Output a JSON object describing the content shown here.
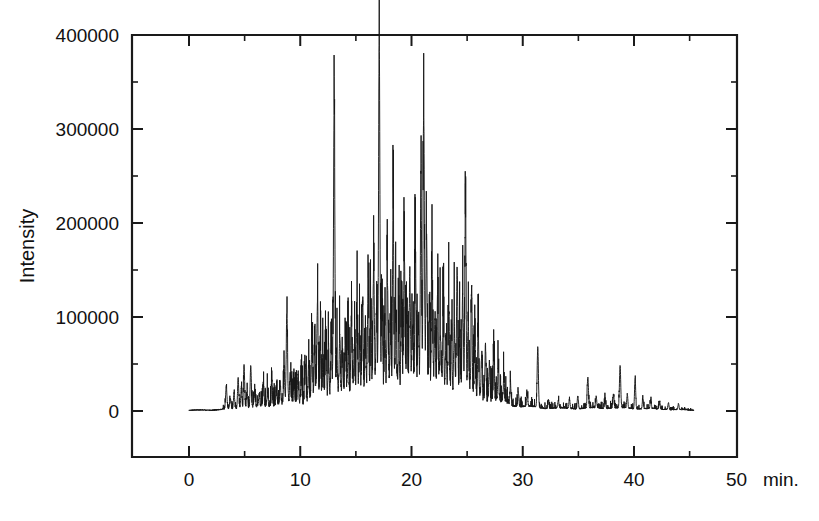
{
  "figure": {
    "name": "chromatogram-figure",
    "background_color": "#ffffff",
    "trace_color": "#171717",
    "axis_color": "#1a1a1a"
  },
  "chart_data": {
    "type": "line",
    "title": "",
    "subtitle": "",
    "xlabel": "",
    "xunit_label": "min.",
    "ylabel": "Intensity",
    "xlim": [
      -1.2,
      49.3
    ],
    "ylim": [
      -12000,
      400000
    ],
    "grid": false,
    "legend": null,
    "annotations": [],
    "x_ticks_major": [
      0,
      10,
      20,
      30,
      40,
      50
    ],
    "x_ticklabels": [
      "0",
      "10",
      "20",
      "30",
      "40",
      "50"
    ],
    "x_ticks_minor": [
      5,
      15,
      25,
      35,
      45
    ],
    "y_ticks_major": [
      0,
      100000,
      200000,
      300000,
      400000
    ],
    "y_ticklabels": [
      "0",
      "100000",
      "200000",
      "300000",
      "400000"
    ],
    "y_ticks_minor": [
      50000,
      150000,
      250000,
      350000
    ],
    "series": [
      {
        "name": "total ion chromatogram",
        "color": "#171717",
        "x_start": 0.0,
        "x_end": 45.4,
        "baseline_envelope": [
          {
            "x": 0.0,
            "y": 1500
          },
          {
            "x": 2.0,
            "y": 1800
          },
          {
            "x": 4.0,
            "y": 4000
          },
          {
            "x": 6.0,
            "y": 7000
          },
          {
            "x": 8.0,
            "y": 11000
          },
          {
            "x": 10.0,
            "y": 16000
          },
          {
            "x": 12.0,
            "y": 24000
          },
          {
            "x": 14.0,
            "y": 30000
          },
          {
            "x": 16.0,
            "y": 35000
          },
          {
            "x": 18.0,
            "y": 39000
          },
          {
            "x": 20.0,
            "y": 41000
          },
          {
            "x": 22.0,
            "y": 39000
          },
          {
            "x": 24.0,
            "y": 34000
          },
          {
            "x": 26.0,
            "y": 25000
          },
          {
            "x": 28.0,
            "y": 16000
          },
          {
            "x": 30.0,
            "y": 9000
          },
          {
            "x": 32.0,
            "y": 6000
          },
          {
            "x": 34.0,
            "y": 5000
          },
          {
            "x": 36.0,
            "y": 5500
          },
          {
            "x": 38.0,
            "y": 6000
          },
          {
            "x": 40.0,
            "y": 5000
          },
          {
            "x": 42.0,
            "y": 4000
          },
          {
            "x": 44.0,
            "y": 2500
          },
          {
            "x": 45.4,
            "y": 1500
          }
        ],
        "peaks": [
          {
            "x": 3.35,
            "h": 24000,
            "w": 0.055
          },
          {
            "x": 3.72,
            "h": 11000,
            "w": 0.05
          },
          {
            "x": 4.05,
            "h": 16000,
            "w": 0.05
          },
          {
            "x": 4.42,
            "h": 33000,
            "w": 0.05
          },
          {
            "x": 4.7,
            "h": 21000,
            "w": 0.05
          },
          {
            "x": 4.95,
            "h": 46000,
            "w": 0.05
          },
          {
            "x": 5.22,
            "h": 17000,
            "w": 0.05
          },
          {
            "x": 5.55,
            "h": 44000,
            "w": 0.05
          },
          {
            "x": 5.9,
            "h": 14000,
            "w": 0.05
          },
          {
            "x": 6.3,
            "h": 12000,
            "w": 0.05
          },
          {
            "x": 6.7,
            "h": 20000,
            "w": 0.05
          },
          {
            "x": 7.05,
            "h": 13000,
            "w": 0.05
          },
          {
            "x": 7.45,
            "h": 27000,
            "w": 0.05
          },
          {
            "x": 7.85,
            "h": 15000,
            "w": 0.05
          },
          {
            "x": 8.2,
            "h": 21000,
            "w": 0.05
          },
          {
            "x": 8.55,
            "h": 33000,
            "w": 0.05
          },
          {
            "x": 8.8,
            "h": 96000,
            "w": 0.055
          },
          {
            "x": 9.1,
            "h": 26000,
            "w": 0.05
          },
          {
            "x": 9.45,
            "h": 18000,
            "w": 0.05
          },
          {
            "x": 9.8,
            "h": 30000,
            "w": 0.05
          },
          {
            "x": 10.1,
            "h": 22000,
            "w": 0.05
          },
          {
            "x": 10.45,
            "h": 41000,
            "w": 0.05
          },
          {
            "x": 10.75,
            "h": 30000,
            "w": 0.05
          },
          {
            "x": 11.05,
            "h": 62000,
            "w": 0.055
          },
          {
            "x": 11.3,
            "h": 48000,
            "w": 0.05
          },
          {
            "x": 11.55,
            "h": 100000,
            "w": 0.055
          },
          {
            "x": 11.8,
            "h": 54000,
            "w": 0.05
          },
          {
            "x": 12.05,
            "h": 36000,
            "w": 0.05
          },
          {
            "x": 12.3,
            "h": 60000,
            "w": 0.05
          },
          {
            "x": 12.55,
            "h": 44000,
            "w": 0.05
          },
          {
            "x": 12.8,
            "h": 51000,
            "w": 0.05
          },
          {
            "x": 13.05,
            "h": 315000,
            "w": 0.06
          },
          {
            "x": 13.3,
            "h": 40000,
            "w": 0.05
          },
          {
            "x": 13.55,
            "h": 63000,
            "w": 0.05
          },
          {
            "x": 13.8,
            "h": 36000,
            "w": 0.05
          },
          {
            "x": 14.05,
            "h": 55000,
            "w": 0.05
          },
          {
            "x": 14.3,
            "h": 41000,
            "w": 0.05
          },
          {
            "x": 14.6,
            "h": 72000,
            "w": 0.05
          },
          {
            "x": 14.85,
            "h": 44000,
            "w": 0.05
          },
          {
            "x": 15.1,
            "h": 86000,
            "w": 0.055
          },
          {
            "x": 15.35,
            "h": 52000,
            "w": 0.05
          },
          {
            "x": 15.6,
            "h": 95000,
            "w": 0.055
          },
          {
            "x": 15.85,
            "h": 58000,
            "w": 0.05
          },
          {
            "x": 16.1,
            "h": 118000,
            "w": 0.055
          },
          {
            "x": 16.35,
            "h": 66000,
            "w": 0.05
          },
          {
            "x": 16.6,
            "h": 131000,
            "w": 0.055
          },
          {
            "x": 16.85,
            "h": 74000,
            "w": 0.05
          },
          {
            "x": 17.1,
            "h": 356000,
            "w": 0.06
          },
          {
            "x": 17.35,
            "h": 89000,
            "w": 0.05
          },
          {
            "x": 17.6,
            "h": 62000,
            "w": 0.05
          },
          {
            "x": 17.85,
            "h": 107000,
            "w": 0.055
          },
          {
            "x": 18.1,
            "h": 68000,
            "w": 0.05
          },
          {
            "x": 18.35,
            "h": 197000,
            "w": 0.055
          },
          {
            "x": 18.6,
            "h": 80000,
            "w": 0.05
          },
          {
            "x": 18.85,
            "h": 56000,
            "w": 0.05
          },
          {
            "x": 19.1,
            "h": 96000,
            "w": 0.05
          },
          {
            "x": 19.35,
            "h": 140000,
            "w": 0.055
          },
          {
            "x": 19.6,
            "h": 73000,
            "w": 0.05
          },
          {
            "x": 19.85,
            "h": 112000,
            "w": 0.055
          },
          {
            "x": 20.1,
            "h": 59000,
            "w": 0.05
          },
          {
            "x": 20.35,
            "h": 135000,
            "w": 0.055
          },
          {
            "x": 20.6,
            "h": 78000,
            "w": 0.05
          },
          {
            "x": 20.85,
            "h": 226000,
            "w": 0.055
          },
          {
            "x": 21.1,
            "h": 291000,
            "w": 0.06
          },
          {
            "x": 21.35,
            "h": 165000,
            "w": 0.055
          },
          {
            "x": 21.6,
            "h": 84000,
            "w": 0.05
          },
          {
            "x": 21.85,
            "h": 120000,
            "w": 0.055
          },
          {
            "x": 22.1,
            "h": 67000,
            "w": 0.05
          },
          {
            "x": 22.35,
            "h": 92000,
            "w": 0.05
          },
          {
            "x": 22.6,
            "h": 54000,
            "w": 0.05
          },
          {
            "x": 22.85,
            "h": 76000,
            "w": 0.05
          },
          {
            "x": 23.1,
            "h": 48000,
            "w": 0.05
          },
          {
            "x": 23.35,
            "h": 88000,
            "w": 0.05
          },
          {
            "x": 23.6,
            "h": 58000,
            "w": 0.05
          },
          {
            "x": 23.85,
            "h": 69000,
            "w": 0.05
          },
          {
            "x": 24.1,
            "h": 132000,
            "w": 0.055
          },
          {
            "x": 24.35,
            "h": 63000,
            "w": 0.05
          },
          {
            "x": 24.6,
            "h": 104000,
            "w": 0.055
          },
          {
            "x": 24.85,
            "h": 185000,
            "w": 0.055
          },
          {
            "x": 25.1,
            "h": 72000,
            "w": 0.05
          },
          {
            "x": 25.4,
            "h": 108000,
            "w": 0.05
          },
          {
            "x": 25.7,
            "h": 52000,
            "w": 0.05
          },
          {
            "x": 26.0,
            "h": 67000,
            "w": 0.05
          },
          {
            "x": 26.3,
            "h": 43000,
            "w": 0.05
          },
          {
            "x": 26.65,
            "h": 56000,
            "w": 0.05
          },
          {
            "x": 27.0,
            "h": 38000,
            "w": 0.05
          },
          {
            "x": 27.4,
            "h": 46000,
            "w": 0.05
          },
          {
            "x": 27.8,
            "h": 30000,
            "w": 0.05
          },
          {
            "x": 28.3,
            "h": 24000,
            "w": 0.05
          },
          {
            "x": 28.9,
            "h": 19000,
            "w": 0.05
          },
          {
            "x": 29.6,
            "h": 15000,
            "w": 0.05
          },
          {
            "x": 30.4,
            "h": 12000,
            "w": 0.05
          },
          {
            "x": 31.35,
            "h": 64000,
            "w": 0.055
          },
          {
            "x": 32.3,
            "h": 9000,
            "w": 0.05
          },
          {
            "x": 33.2,
            "h": 8000,
            "w": 0.05
          },
          {
            "x": 34.2,
            "h": 10000,
            "w": 0.05
          },
          {
            "x": 34.95,
            "h": 14000,
            "w": 0.05
          },
          {
            "x": 35.85,
            "h": 33000,
            "w": 0.055
          },
          {
            "x": 36.6,
            "h": 12000,
            "w": 0.05
          },
          {
            "x": 37.4,
            "h": 11000,
            "w": 0.05
          },
          {
            "x": 38.15,
            "h": 15000,
            "w": 0.05
          },
          {
            "x": 38.75,
            "h": 45000,
            "w": 0.055
          },
          {
            "x": 39.4,
            "h": 14000,
            "w": 0.05
          },
          {
            "x": 40.1,
            "h": 33000,
            "w": 0.05
          },
          {
            "x": 40.8,
            "h": 11000,
            "w": 0.05
          },
          {
            "x": 41.5,
            "h": 9000,
            "w": 0.05
          },
          {
            "x": 42.3,
            "h": 8000,
            "w": 0.05
          },
          {
            "x": 43.1,
            "h": 7000,
            "w": 0.05
          },
          {
            "x": 44.0,
            "h": 6000,
            "w": 0.05
          }
        ],
        "noise_amplitude": 4200,
        "noise_seed": 20240517
      }
    ]
  },
  "plot_geometry": {
    "left_px": 132,
    "right_px": 737,
    "top_px": 35,
    "bottom_px": 457,
    "zero_y_px": 411
  }
}
